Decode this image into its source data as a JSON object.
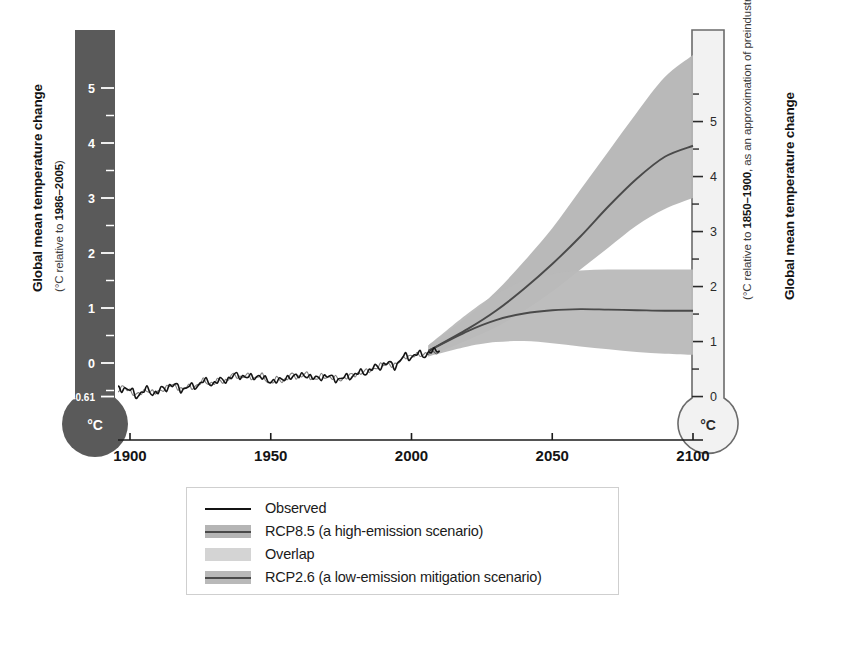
{
  "axes": {
    "left": {
      "title": "Global mean temperature change",
      "subtitle_prefix": "(°C relative to ",
      "subtitle_bold": "1986–2005",
      "subtitle_suffix": ")",
      "unit_label": "°C",
      "ticks": [
        "5",
        "4",
        "3",
        "2",
        "1",
        "0",
        "-0.61"
      ],
      "tick_values": [
        5,
        4,
        3,
        2,
        1,
        0,
        -0.61
      ],
      "fill_color": "#5a5a5a",
      "text_color": "#ffffff"
    },
    "right": {
      "title": "Global mean temperature change",
      "subtitle_prefix": "(°C relative to ",
      "subtitle_bold": "1850–1900",
      "subtitle_suffix": ", as an approximation of preindustrial levels)",
      "unit_label": "°C",
      "ticks": [
        "5",
        "4",
        "3",
        "2",
        "1",
        "0"
      ],
      "tick_values": [
        5,
        4,
        3,
        2,
        1,
        0
      ],
      "fill_color": "#f2f2f2",
      "stroke_color": "#6b6b6b",
      "text_color": "#2a2a2a"
    },
    "x": {
      "ticks": [
        "1900",
        "1950",
        "2000",
        "2050",
        "2100"
      ],
      "tick_values": [
        1900,
        1950,
        2000,
        2050,
        2100
      ],
      "range": [
        1890,
        2100
      ]
    }
  },
  "legend": {
    "items": [
      {
        "label": "Observed",
        "swatch": "line",
        "line_color": "#141414",
        "band_color": null
      },
      {
        "label": "RCP8.5 (a high-emission scenario)",
        "swatch": "band-line",
        "line_color": "#4a4a4a",
        "band_color": "#b5b5b5"
      },
      {
        "label": "Overlap",
        "swatch": "band",
        "line_color": null,
        "band_color": "#d4d4d4"
      },
      {
        "label": "RCP2.6 (a low-emission mitigation scenario)",
        "swatch": "band-line",
        "line_color": "#4a4a4a",
        "band_color": "#b9b9b9"
      }
    ]
  },
  "chart_data": {
    "type": "line",
    "title": "Global mean temperature change",
    "xlabel": "",
    "ylabel": "Global mean temperature change (°C relative to 1986–2005)",
    "xlim": [
      1890,
      2100
    ],
    "ylim": [
      -0.61,
      5.6
    ],
    "y_right_offset": 0.61,
    "grid": false,
    "legend_position": "bottom",
    "series": [
      {
        "name": "Observed",
        "color": "#141414",
        "type": "line",
        "x": [
          1890,
          1894,
          1898,
          1902,
          1906,
          1910,
          1914,
          1918,
          1922,
          1926,
          1930,
          1934,
          1938,
          1942,
          1946,
          1950,
          1954,
          1958,
          1962,
          1966,
          1970,
          1974,
          1978,
          1982,
          1986,
          1990,
          1994,
          1998,
          2002,
          2006,
          2010
        ],
        "y": [
          -0.46,
          -0.52,
          -0.44,
          -0.58,
          -0.5,
          -0.54,
          -0.4,
          -0.46,
          -0.44,
          -0.34,
          -0.36,
          -0.3,
          -0.22,
          -0.26,
          -0.24,
          -0.34,
          -0.3,
          -0.24,
          -0.22,
          -0.28,
          -0.24,
          -0.3,
          -0.24,
          -0.18,
          -0.12,
          -0.02,
          -0.04,
          0.12,
          0.14,
          0.18,
          0.22
        ]
      },
      {
        "name": "RCP8.5 (a high-emission scenario)",
        "color": "#4a4a4a",
        "band_color": "#b5b5b5",
        "type": "line-band",
        "x": [
          2006,
          2020,
          2030,
          2040,
          2050,
          2060,
          2070,
          2080,
          2090,
          2100
        ],
        "y": [
          0.22,
          0.62,
          0.95,
          1.35,
          1.8,
          2.3,
          2.85,
          3.35,
          3.75,
          3.95
        ],
        "y_lower": [
          0.12,
          0.42,
          0.65,
          0.95,
          1.3,
          1.7,
          2.1,
          2.5,
          2.8,
          3.0
        ],
        "y_upper": [
          0.32,
          0.85,
          1.3,
          1.85,
          2.45,
          3.15,
          3.85,
          4.55,
          5.2,
          5.6
        ]
      },
      {
        "name": "RCP2.6 (a low-emission mitigation scenario)",
        "color": "#4a4a4a",
        "band_color": "#b9b9b9",
        "type": "line-band",
        "x": [
          2006,
          2020,
          2030,
          2040,
          2050,
          2060,
          2070,
          2080,
          2090,
          2100
        ],
        "y": [
          0.22,
          0.58,
          0.78,
          0.9,
          0.96,
          0.98,
          0.97,
          0.96,
          0.95,
          0.95
        ],
        "y_lower": [
          0.12,
          0.3,
          0.38,
          0.4,
          0.36,
          0.3,
          0.25,
          0.2,
          0.17,
          0.15
        ],
        "y_upper": [
          0.32,
          0.9,
          1.25,
          1.5,
          1.62,
          1.68,
          1.7,
          1.7,
          1.7,
          1.7
        ]
      }
    ]
  }
}
